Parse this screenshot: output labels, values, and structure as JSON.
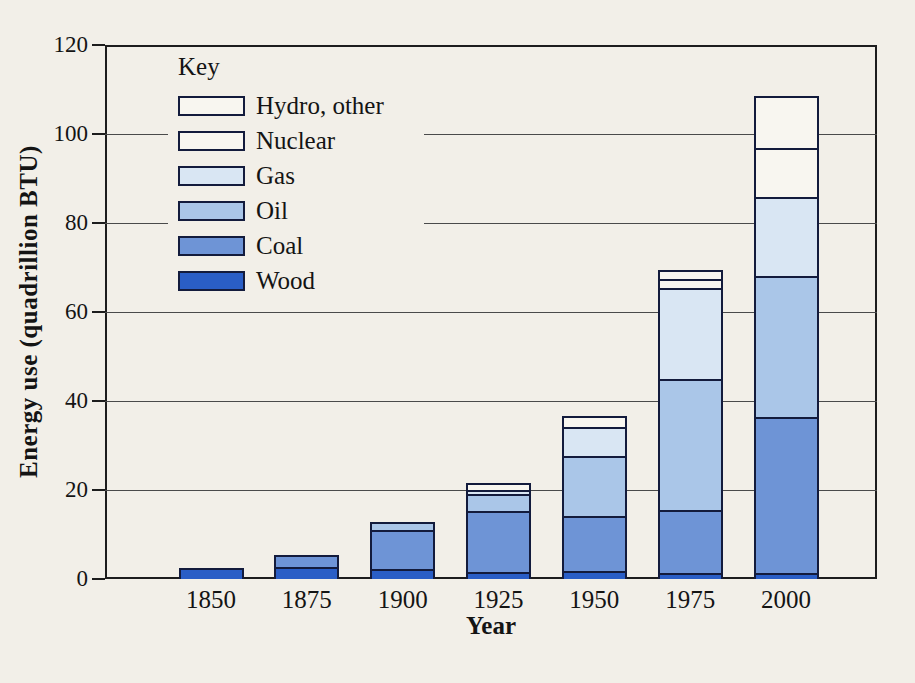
{
  "figure": {
    "kind": "textbook stacked bar chart (scanned print figure)"
  },
  "colors": {
    "paper_background": "#f2efe8",
    "pattern_background": "#f8f6f0",
    "pattern_line_blue": "#4d72bd",
    "segment_border_navy": "#131b3c",
    "frame_black": "#1d1d1d",
    "gridline_gray": "#4a4a4a",
    "text_black": "#141414"
  },
  "chart_data": {
    "type": "bar",
    "stacked": true,
    "title": "",
    "xlabel": "Year",
    "ylabel": "Energy use (quadrillion BTU)",
    "ylim": [
      0,
      120
    ],
    "yticks": [
      0,
      20,
      40,
      60,
      80,
      100,
      120
    ],
    "grid": true,
    "legend_title": "Key",
    "legend_position": "top-left inside plot",
    "legend_order_top_to_bottom": [
      "Hydro, other",
      "Nuclear",
      "Gas",
      "Oil",
      "Coal",
      "Wood"
    ],
    "categories": [
      "1850",
      "1875",
      "1900",
      "1925",
      "1950",
      "1975",
      "2000"
    ],
    "series": [
      {
        "name": "Wood",
        "color": "#2a5ec6",
        "pattern": "solid",
        "values": [
          2.5,
          2.8,
          2.2,
          1.6,
          1.7,
          1.4,
          1.4
        ]
      },
      {
        "name": "Coal",
        "color": "#6e94d6",
        "pattern": "solid",
        "values": [
          0,
          2.7,
          8.8,
          13.6,
          12.4,
          14.0,
          35.1
        ]
      },
      {
        "name": "Oil",
        "color": "#aac6e8",
        "pattern": "solid",
        "values": [
          0,
          0,
          1.8,
          3.8,
          13.5,
          29.6,
          31.7
        ]
      },
      {
        "name": "Gas",
        "color": "#d9e6f3",
        "pattern": "solid",
        "values": [
          0,
          0,
          0,
          1.0,
          6.5,
          20.5,
          17.6
        ]
      },
      {
        "name": "Nuclear",
        "color": "#f8f6f0",
        "pattern": "vertical-lines",
        "values": [
          0,
          0,
          0,
          0,
          0,
          2.0,
          11.1
        ]
      },
      {
        "name": "Hydro, other",
        "color": "#f8f6f0",
        "pattern": "diagonal-hatch",
        "values": [
          0,
          0,
          0,
          1.5,
          2.6,
          2.0,
          11.6
        ]
      }
    ],
    "stack_totals": [
      2.5,
      5.5,
      12.8,
      21.5,
      36.7,
      69.5,
      108.5
    ]
  }
}
